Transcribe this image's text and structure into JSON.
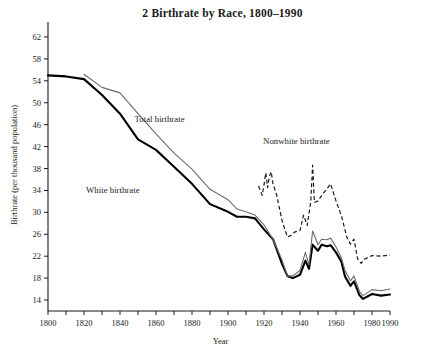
{
  "figure": {
    "number": "2",
    "title": "2  Birthrate by Race, 1800–1990",
    "xlabel": "Year",
    "ylabel": "Birthrate (per thousand population)",
    "footnote_artifact": ""
  },
  "chart_data": {
    "type": "line",
    "title": "2  Birthrate by Race, 1800–1990",
    "xlabel": "Year",
    "ylabel": "Birthrate (per thousand population)",
    "xlim": [
      1800,
      1990
    ],
    "ylim": [
      12,
      64
    ],
    "grid": false,
    "legend": "inline-annotations",
    "x_major_ticks": [
      1800,
      1820,
      1840,
      1860,
      1880,
      1900,
      1920,
      1940,
      1960,
      1980,
      1990
    ],
    "x_minor_tick_step": 10,
    "y_ticks": [
      14,
      18,
      22,
      26,
      30,
      34,
      38,
      42,
      46,
      50,
      54,
      58,
      62
    ],
    "annotations": [
      {
        "text": "Total birthrate",
        "x": 1862,
        "y": 46.5
      },
      {
        "text": "White birthrate",
        "x": 1836,
        "y": 33.5
      },
      {
        "text": "Nonwhite birthrate",
        "x": 1938,
        "y": 42.5
      }
    ],
    "series": [
      {
        "name": "White birthrate",
        "style": "thick-solid-black",
        "color": "#000000",
        "points": [
          [
            1800,
            55.0
          ],
          [
            1810,
            54.8
          ],
          [
            1820,
            54.3
          ],
          [
            1830,
            51.4
          ],
          [
            1840,
            48.0
          ],
          [
            1850,
            43.3
          ],
          [
            1860,
            41.4
          ],
          [
            1870,
            38.3
          ],
          [
            1880,
            35.2
          ],
          [
            1890,
            31.5
          ],
          [
            1900,
            30.1
          ],
          [
            1905,
            29.2
          ],
          [
            1910,
            29.2
          ],
          [
            1915,
            28.9
          ],
          [
            1920,
            26.9
          ],
          [
            1925,
            25.1
          ],
          [
            1930,
            20.6
          ],
          [
            1933,
            18.4
          ],
          [
            1936,
            18.0
          ],
          [
            1940,
            18.6
          ],
          [
            1943,
            21.2
          ],
          [
            1945,
            19.7
          ],
          [
            1947,
            24.1
          ],
          [
            1950,
            23.0
          ],
          [
            1952,
            24.1
          ],
          [
            1955,
            23.8
          ],
          [
            1957,
            24.0
          ],
          [
            1960,
            22.7
          ],
          [
            1963,
            21.0
          ],
          [
            1965,
            18.3
          ],
          [
            1968,
            16.6
          ],
          [
            1970,
            17.4
          ],
          [
            1973,
            14.9
          ],
          [
            1975,
            14.2
          ],
          [
            1980,
            15.1
          ],
          [
            1985,
            14.8
          ],
          [
            1990,
            15.0
          ]
        ]
      },
      {
        "name": "Total birthrate",
        "style": "thin-solid-gray",
        "color": "#6b6b6b",
        "points": [
          [
            1820,
            55.2
          ],
          [
            1830,
            52.8
          ],
          [
            1840,
            51.8
          ],
          [
            1850,
            48.0
          ],
          [
            1860,
            44.3
          ],
          [
            1870,
            40.8
          ],
          [
            1880,
            37.9
          ],
          [
            1890,
            34.2
          ],
          [
            1900,
            32.3
          ],
          [
            1905,
            30.6
          ],
          [
            1910,
            30.1
          ],
          [
            1915,
            29.5
          ],
          [
            1920,
            27.7
          ],
          [
            1925,
            25.1
          ],
          [
            1930,
            21.3
          ],
          [
            1933,
            18.4
          ],
          [
            1936,
            18.4
          ],
          [
            1940,
            19.4
          ],
          [
            1943,
            22.7
          ],
          [
            1945,
            20.4
          ],
          [
            1947,
            26.6
          ],
          [
            1950,
            24.1
          ],
          [
            1952,
            25.1
          ],
          [
            1955,
            25.0
          ],
          [
            1957,
            25.3
          ],
          [
            1960,
            23.7
          ],
          [
            1963,
            21.7
          ],
          [
            1965,
            19.4
          ],
          [
            1968,
            17.5
          ],
          [
            1970,
            18.4
          ],
          [
            1973,
            15.6
          ],
          [
            1975,
            14.8
          ],
          [
            1980,
            15.9
          ],
          [
            1985,
            15.7
          ],
          [
            1990,
            16.0
          ]
        ]
      },
      {
        "name": "Nonwhite birthrate",
        "style": "dashed-black",
        "color": "#1a1a1a",
        "points": [
          [
            1917,
            34.8
          ],
          [
            1919,
            33.1
          ],
          [
            1920,
            35.0
          ],
          [
            1921,
            37.2
          ],
          [
            1922,
            34.5
          ],
          [
            1923,
            36.6
          ],
          [
            1924,
            37.4
          ],
          [
            1925,
            35.2
          ],
          [
            1927,
            33.2
          ],
          [
            1930,
            28.5
          ],
          [
            1933,
            25.5
          ],
          [
            1935,
            25.8
          ],
          [
            1937,
            26.4
          ],
          [
            1940,
            26.7
          ],
          [
            1942,
            29.5
          ],
          [
            1944,
            27.6
          ],
          [
            1946,
            32.0
          ],
          [
            1947,
            38.6
          ],
          [
            1948,
            31.8
          ],
          [
            1950,
            32.1
          ],
          [
            1953,
            33.5
          ],
          [
            1955,
            34.3
          ],
          [
            1957,
            35.2
          ],
          [
            1960,
            32.1
          ],
          [
            1963,
            29.4
          ],
          [
            1966,
            25.5
          ],
          [
            1968,
            24.2
          ],
          [
            1970,
            25.1
          ],
          [
            1972,
            21.5
          ],
          [
            1974,
            20.7
          ],
          [
            1976,
            21.5
          ],
          [
            1980,
            22.1
          ],
          [
            1985,
            22.0
          ],
          [
            1990,
            22.2
          ]
        ]
      }
    ]
  }
}
